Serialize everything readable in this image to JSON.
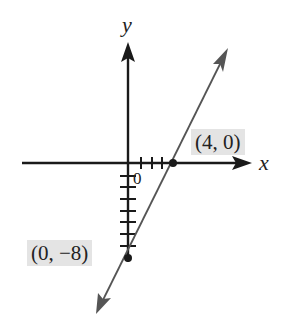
{
  "diagram": {
    "type": "coordinate-plane-line-graph",
    "axes": {
      "x_label": "x",
      "y_label": "y",
      "origin_label": "0"
    },
    "points": [
      {
        "label": "(4, 0)",
        "x": 4,
        "y": 0
      },
      {
        "label": "(0, −8)",
        "x": 0,
        "y": -8
      }
    ],
    "line": {
      "through": [
        [
          4,
          0
        ],
        [
          0,
          -8
        ]
      ],
      "slope": 2,
      "intercept": -8,
      "equation": "y = 2x − 8"
    },
    "ticks": {
      "x_positive": 3,
      "y_negative": 7
    },
    "colors": {
      "axis": "#1a1a1a",
      "line": "#555555",
      "label_box": "#e4e4e4"
    }
  }
}
